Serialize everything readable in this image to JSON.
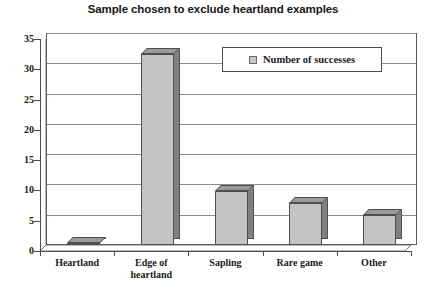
{
  "chart_data": {
    "type": "bar",
    "title": "Sample chosen to exclude heartland examples",
    "xlabel": "",
    "ylabel": "",
    "categories": [
      "Heartland",
      "Edge of heartland",
      "Sapling",
      "Rare game",
      "Other"
    ],
    "series": [
      {
        "name": "Number of successes",
        "values": [
          0,
          31.5,
          9,
          7,
          5
        ]
      }
    ],
    "ylim": [
      0,
      35
    ],
    "yticks": [
      0,
      5,
      10,
      15,
      20,
      25,
      30,
      35
    ],
    "ytick_labels": [
      "0",
      "5",
      "10",
      "15",
      "20",
      "25",
      "30",
      "35"
    ],
    "grid": true,
    "legend": {
      "position": "top-center-inside",
      "entries": [
        {
          "label": "Number of successes",
          "color": "#c4c4c4"
        }
      ]
    },
    "category_labels_multiline": [
      [
        "Heartland"
      ],
      [
        "Edge of",
        "heartland"
      ],
      [
        "Sapling"
      ],
      [
        "Rare game"
      ],
      [
        "Other"
      ]
    ],
    "colors": {
      "bar_face": "#c4c4c4",
      "bar_side": "#808080",
      "bar_top": "#9a9a9a",
      "bar_outline": "#4f4f4f",
      "gridline": "#8c8c8c",
      "axis": "#4d4d4d",
      "plot_background": "#ffffff",
      "text": "#1a1a1a",
      "title_text": "#161616"
    }
  }
}
